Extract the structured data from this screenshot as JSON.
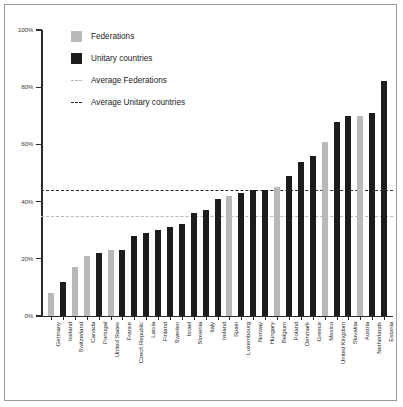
{
  "legend": {
    "items": [
      {
        "label": "Federations",
        "key": "swatch-federations",
        "color": "#b9b9b9"
      },
      {
        "label": "Unitary countries",
        "key": "swatch-unitary",
        "color": "#1c1c1c"
      },
      {
        "label": "Average Federations",
        "key": "dash-avg-federations",
        "color": "#b9b9b9"
      },
      {
        "label": "Average Unitary countries",
        "key": "dash-avg-unitary",
        "color": "#2b2b2b"
      }
    ]
  },
  "axis": {
    "y_ticks": [
      "0%",
      "20%",
      "40%",
      "60%",
      "80%",
      "100%"
    ],
    "y_tick_values": [
      0,
      20,
      40,
      60,
      80,
      100
    ]
  },
  "chart_data": {
    "type": "bar",
    "title": "",
    "xlabel": "",
    "ylabel": "",
    "ylim": [
      0,
      100
    ],
    "grid": false,
    "legend_position": "top-left",
    "categories": [
      "Germany",
      "Iceland",
      "Switzerland",
      "Canada",
      "Portugal",
      "United States",
      "France",
      "Czech Republic",
      "Latvia",
      "Finland",
      "Sweden",
      "Israel",
      "Slovenia",
      "Italy",
      "Ireland",
      "Spain",
      "Luxembourg",
      "Norway",
      "Hungary",
      "Belgium",
      "Poland",
      "Denmark",
      "Greece",
      "Mexico",
      "United Kingdom",
      "Slovakia",
      "Austria",
      "Netherlands",
      "Estonia"
    ],
    "values": [
      8,
      12,
      17,
      21,
      22,
      23,
      23,
      28,
      29,
      30,
      31,
      32,
      36,
      37,
      41,
      42,
      43,
      44,
      44,
      45,
      49,
      54,
      56,
      61,
      68,
      70,
      70,
      71,
      82
    ],
    "types": [
      "fed",
      "uni",
      "fed",
      "fed",
      "uni",
      "fed",
      "uni",
      "uni",
      "uni",
      "uni",
      "uni",
      "uni",
      "uni",
      "uni",
      "uni",
      "fed",
      "uni",
      "uni",
      "uni",
      "fed",
      "uni",
      "uni",
      "uni",
      "fed",
      "uni",
      "uni",
      "fed",
      "uni",
      "uni"
    ],
    "series": [
      {
        "name": "Federations",
        "color": "#b9b9b9"
      },
      {
        "name": "Unitary countries",
        "color": "#1c1c1c"
      }
    ],
    "annotations": [
      {
        "name": "Average Unitary countries",
        "type": "hline",
        "value": 44,
        "color": "#2b2b2b",
        "style": "dashed"
      },
      {
        "name": "Average Federations",
        "type": "hline",
        "value": 35,
        "color": "#b9b9b9",
        "style": "dashed"
      }
    ]
  }
}
